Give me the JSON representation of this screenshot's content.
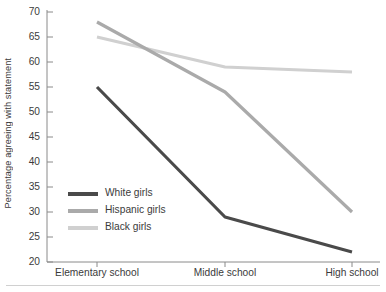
{
  "chart_data": {
    "type": "line",
    "title": "",
    "xlabel": "",
    "ylabel": "Percentage agreeing with statement",
    "categories": [
      "Elementary school",
      "Middle school",
      "High school"
    ],
    "ylim": [
      20,
      70
    ],
    "yticks": [
      20,
      25,
      30,
      35,
      40,
      45,
      50,
      55,
      60,
      65,
      70
    ],
    "grid": false,
    "legend_position": "inside-left-lower",
    "series": [
      {
        "name": "White girls",
        "values": [
          55,
          29,
          22
        ],
        "color": "#4a4a4a"
      },
      {
        "name": "Hispanic girls",
        "values": [
          68,
          54,
          30
        ],
        "color": "#aaaaaa"
      },
      {
        "name": "Black girls",
        "values": [
          65,
          59,
          58
        ],
        "color": "#d0d0d0"
      }
    ]
  },
  "axis": {
    "y_title": "Percentage agreeing with statement",
    "y_tick_labels": [
      "70",
      "65",
      "60",
      "55",
      "50",
      "45",
      "40",
      "35",
      "30",
      "25",
      "20"
    ],
    "x_tick_labels": [
      "Elementary school",
      "Middle school",
      "High school"
    ]
  },
  "legend": {
    "items": [
      {
        "label": "White girls"
      },
      {
        "label": "Hispanic girls"
      },
      {
        "label": "Black girls"
      }
    ]
  },
  "colors": {
    "axis": "#8a8a8a",
    "text": "#3b3b3b",
    "series_white_girls": "#4a4a4a",
    "series_hispanic_girls": "#aaaaaa",
    "series_black_girls": "#d0d0d0",
    "rule": "#d0d0d0"
  }
}
